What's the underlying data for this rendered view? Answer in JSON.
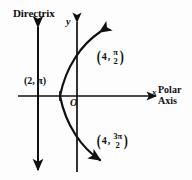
{
  "figure": {
    "colors": {
      "ink": "#101010",
      "background": "#fdfdfd"
    },
    "directrix": {
      "label": "Directrix",
      "orientation": "vertical",
      "x_pixel": 38,
      "arrows": "both"
    },
    "axes": {
      "y_label": "y",
      "x_label": "x",
      "origin_label": "O",
      "polar_axis_label_line1": "Polar",
      "polar_axis_label_line2": "Axis"
    },
    "points": [
      {
        "name": "vertex-point",
        "text": "(2, π)",
        "r": "2",
        "theta": "π",
        "theta_numerator": "",
        "theta_denominator": ""
      },
      {
        "name": "upper-point",
        "text": "(4, π/2)",
        "r": "4",
        "theta": "π/2",
        "theta_numerator": "π",
        "theta_denominator": "2"
      },
      {
        "name": "lower-point",
        "text": "(4, 3π/2)",
        "r": "4",
        "theta": "3π/2",
        "theta_numerator": "3π",
        "theta_denominator": "2"
      }
    ],
    "curve": {
      "type": "parabola",
      "opens": "right",
      "vertex_pixel": [
        60,
        96
      ],
      "arrows": "both"
    },
    "punctuation": {
      "open_paren": "(",
      "close_paren": ")",
      "comma": ","
    }
  }
}
